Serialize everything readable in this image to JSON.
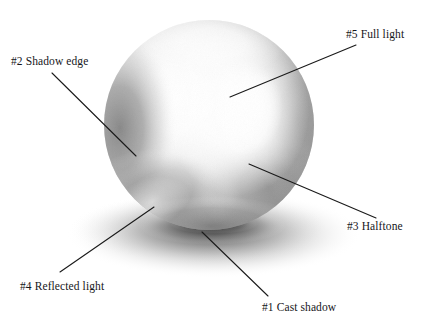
{
  "figure": {
    "background_color": "#ffffff",
    "line_color": "#1a1a1a",
    "text_color": "#16161a",
    "width": 428,
    "height": 324
  },
  "sphere": {
    "center_x": 209,
    "center_y": 125,
    "radius": 105,
    "highlight_x": 243,
    "highlight_y": 110,
    "core_shadow_color": "#8a8a8a",
    "light_color": "#ffffff"
  },
  "cast_shadow": {
    "center_x": 214,
    "center_y": 234,
    "radius_x": 148,
    "radius_y": 44,
    "color": "#9a9a9a"
  },
  "annotations": [
    {
      "id": "1",
      "label": "#1 Cast shadow",
      "tip_x": 202,
      "tip_y": 232,
      "end_x": 268,
      "end_y": 296
    },
    {
      "id": "2",
      "label": "#2 Shadow edge",
      "tip_x": 136,
      "tip_y": 156,
      "end_x": 52,
      "end_y": 73
    },
    {
      "id": "3",
      "label": "#3 Halftone",
      "tip_x": 249,
      "tip_y": 164,
      "end_x": 376,
      "end_y": 218
    },
    {
      "id": "4",
      "label": "#4 Reflected light",
      "tip_x": 154,
      "tip_y": 207,
      "end_x": 60,
      "end_y": 272
    },
    {
      "id": "5",
      "label": "#5 Full light",
      "tip_x": 230,
      "tip_y": 97,
      "end_x": 356,
      "end_y": 45
    }
  ]
}
